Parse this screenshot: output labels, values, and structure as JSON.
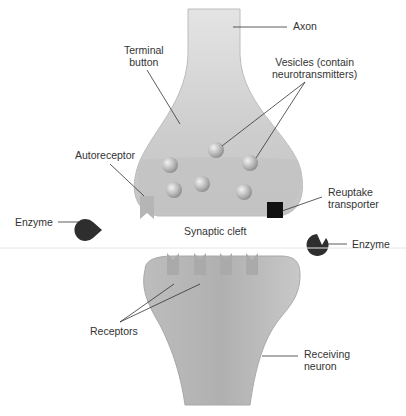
{
  "diagram": {
    "colors": {
      "cell_fill": "#cfcfcf",
      "cell_dark": "#b3b3b3",
      "vesicle": "#bdbdbd",
      "enzyme": "#2e2e2e",
      "transporter": "#111111",
      "receptor": "#b0b0b0",
      "line": "#333333",
      "text": "#333333"
    },
    "labels": {
      "axon": "Axon",
      "terminal_button": "Terminal\nbutton",
      "vesicles": "Vesicles (contain\nneurotransmitters)",
      "autoreceptor": "Autoreceptor",
      "reuptake_transporter": "Reuptake\ntransporter",
      "enzyme_left": "Enzyme",
      "enzyme_right": "Enzyme",
      "synaptic_cleft": "Synaptic cleft",
      "receptors": "Receptors",
      "receiving_neuron": "Receiving\nneuron"
    },
    "vesicle_count": 7,
    "receptor_count": 4
  }
}
